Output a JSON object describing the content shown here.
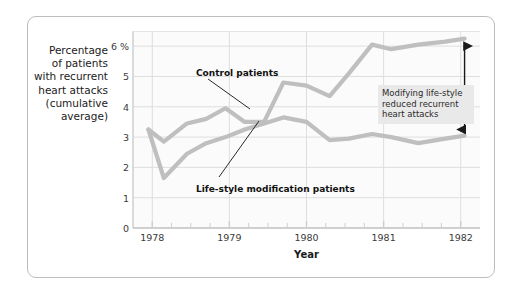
{
  "chart_data": {
    "type": "line",
    "title": "",
    "subtitle": "",
    "xlabel": "Year",
    "ylabel": "Percentage of patients with recurrent heart attacks (cumulative average)",
    "ylabel_lines": [
      "Percentage",
      "of patients",
      "with recurrent",
      "heart attacks",
      "(cumulative",
      "average)"
    ],
    "xlim": [
      1977.75,
      1982.25
    ],
    "ylim": [
      0,
      6.5
    ],
    "yticks": [
      0,
      1,
      2,
      3,
      4,
      5,
      6
    ],
    "ytick_labels": [
      "0",
      "1",
      "2",
      "3",
      "4",
      "5",
      "6 %"
    ],
    "xticks": [
      1978,
      1979,
      1980,
      1981,
      1982
    ],
    "xtick_labels": [
      "1978",
      "1979",
      "1980",
      "1981",
      "1982"
    ],
    "x_minor_ticks_per_year": 4,
    "grid": true,
    "grid_color": "#dedede",
    "legend": "none (inline callouts)",
    "series": [
      {
        "name": "Control patients",
        "color": "#bfbfbf",
        "x": [
          1977.95,
          1978.15,
          1978.45,
          1978.7,
          1978.95,
          1979.2,
          1979.45,
          1979.7,
          1980.0,
          1980.3,
          1980.55,
          1980.85,
          1981.1,
          1981.45,
          1981.8,
          1982.05
        ],
        "values": [
          3.25,
          2.85,
          3.45,
          3.6,
          3.95,
          3.5,
          3.5,
          4.8,
          4.7,
          4.35,
          5.1,
          6.05,
          5.9,
          6.05,
          6.15,
          6.25
        ]
      },
      {
        "name": "Life-style modification patients",
        "color": "#bfbfbf",
        "x": [
          1977.95,
          1978.15,
          1978.45,
          1978.7,
          1978.95,
          1979.2,
          1979.45,
          1979.7,
          1980.0,
          1980.3,
          1980.55,
          1980.85,
          1981.1,
          1981.45,
          1981.8,
          1982.05
        ],
        "values": [
          3.25,
          1.65,
          2.45,
          2.8,
          3.0,
          3.25,
          3.45,
          3.65,
          3.5,
          2.9,
          2.95,
          3.1,
          3.0,
          2.8,
          2.95,
          3.05
        ]
      }
    ],
    "annotations": [
      {
        "name": "control-callout",
        "text": "Control patients",
        "points_to_series": "Control patients"
      },
      {
        "name": "lifestyle-callout",
        "text": "Life-style modification patients",
        "points_to_series": "Life-style modification patients"
      },
      {
        "name": "gap-note",
        "text": "Modifying life-style reduced recurrent heart attacks",
        "lines": [
          "Modifying life-style",
          "reduced recurrent",
          "heart attacks"
        ],
        "background": "#e9e9e9"
      },
      {
        "name": "gap-arrow",
        "type": "double-headed-vertical-arrow",
        "from_value": 6.2,
        "to_value": 3.05,
        "at_x": 1982.05,
        "color": "#1a1a1a"
      }
    ]
  },
  "annotation_box": {
    "line1": "Modifying life-style",
    "line2": "reduced recurrent",
    "line3": "heart attacks"
  },
  "callouts": {
    "control": "Control patients",
    "lifestyle": "Life-style modification patients"
  },
  "axis": {
    "x_title": "Year"
  },
  "colors": {
    "line": "#bfbfbf",
    "grid": "#dedede",
    "frame": "#bdbdbd",
    "plot_bg": "#fbfbfb",
    "anno_bg": "#e9e9e9",
    "text": "#1b1b1b"
  }
}
